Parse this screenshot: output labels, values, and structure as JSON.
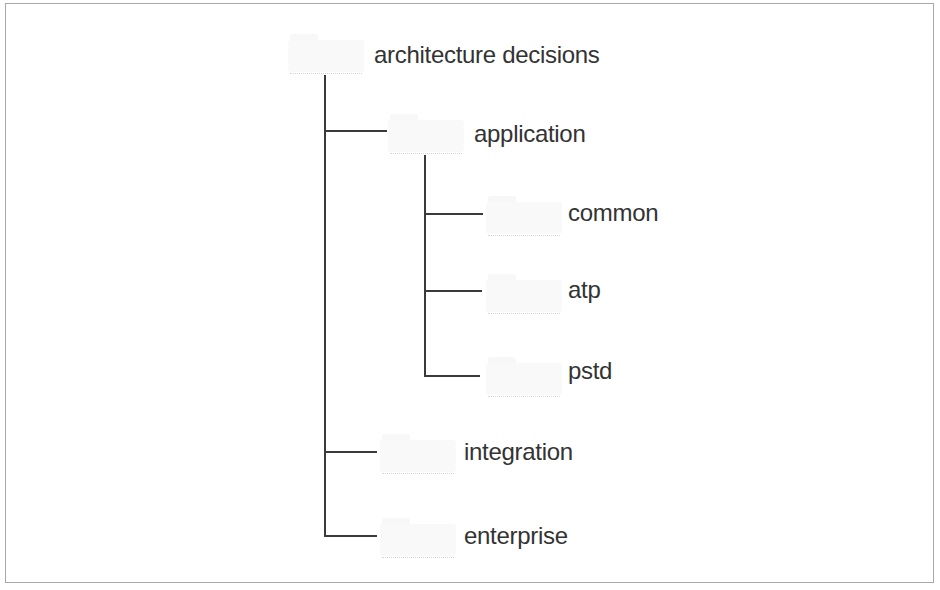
{
  "diagram": {
    "type": "folder-tree",
    "root": {
      "label": "architecture decisions",
      "icon": "folder-icon",
      "children": [
        {
          "label": "application",
          "icon": "folder-icon",
          "children": [
            {
              "label": "common",
              "icon": "folder-icon"
            },
            {
              "label": "atp",
              "icon": "folder-icon"
            },
            {
              "label": "pstd",
              "icon": "folder-icon"
            }
          ]
        },
        {
          "label": "integration",
          "icon": "folder-icon"
        },
        {
          "label": "enterprise",
          "icon": "folder-icon"
        }
      ]
    },
    "colors": {
      "line": "#3a3a3a",
      "text": "#333333",
      "border": "#a8a8a8",
      "folder": "#f8f8f8"
    }
  }
}
